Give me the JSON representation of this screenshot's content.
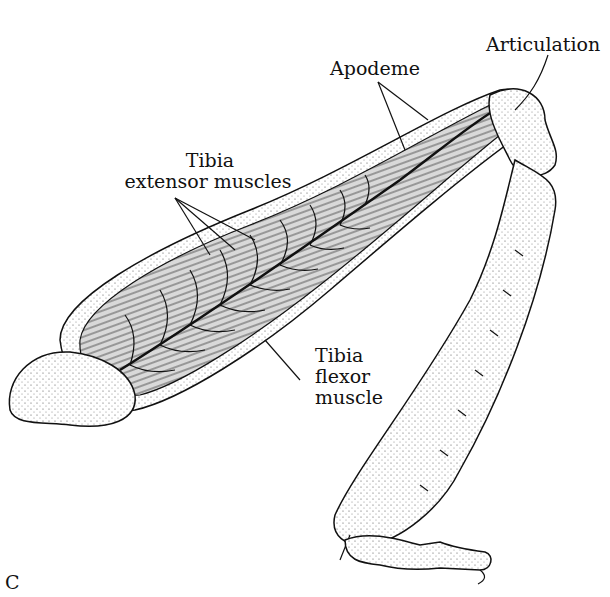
{
  "figure": {
    "panel_label": "C",
    "labels": {
      "articulation": "Articulation",
      "apodeme": "Apodeme",
      "extensor_line1": "Tibia",
      "extensor_line2": "extensor muscles",
      "flexor_line1": "Tibia",
      "flexor_line2": "flexor",
      "flexor_line3": "muscle"
    }
  }
}
